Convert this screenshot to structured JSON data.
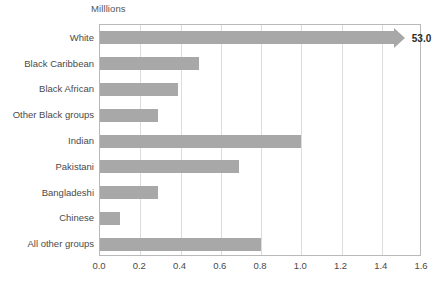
{
  "chart_data": {
    "type": "bar",
    "orientation": "horizontal",
    "title": "Milllions",
    "xlabel": "",
    "ylabel": "",
    "xlim": [
      0.0,
      1.6
    ],
    "xticks": [
      "0.0",
      "0.2",
      "0.4",
      "0.6",
      "0.8",
      "1.0",
      "1.2",
      "1.4",
      "1.6"
    ],
    "xtick_values": [
      0.0,
      0.2,
      0.4,
      0.6,
      0.8,
      1.0,
      1.2,
      1.4,
      1.6
    ],
    "grid": "vertical",
    "legend": "none",
    "bar_color": "#a8a8a8",
    "categories": [
      "White",
      "Black Caribbean",
      "Black African",
      "Other Black groups",
      "Indian",
      "Pakistani",
      "Bangladeshi",
      "Chinese",
      "All other groups"
    ],
    "values": [
      53.0,
      0.49,
      0.39,
      0.29,
      1.0,
      0.69,
      0.29,
      0.1,
      0.8
    ],
    "bars": [
      {
        "category": "White",
        "value": 53.0,
        "plotted": 1.46,
        "truncated": true,
        "label": "53.0"
      },
      {
        "category": "Black Caribbean",
        "value": 0.49,
        "plotted": 0.49,
        "truncated": false,
        "label": ""
      },
      {
        "category": "Black African",
        "value": 0.39,
        "plotted": 0.39,
        "truncated": false,
        "label": ""
      },
      {
        "category": "Other Black groups",
        "value": 0.29,
        "plotted": 0.29,
        "truncated": false,
        "label": ""
      },
      {
        "category": "Indian",
        "value": 1.0,
        "plotted": 1.0,
        "truncated": false,
        "label": ""
      },
      {
        "category": "Pakistani",
        "value": 0.69,
        "plotted": 0.69,
        "truncated": false,
        "label": ""
      },
      {
        "category": "Bangladeshi",
        "value": 0.29,
        "plotted": 0.29,
        "truncated": false,
        "label": ""
      },
      {
        "category": "Chinese",
        "value": 0.1,
        "plotted": 0.1,
        "truncated": false,
        "label": ""
      },
      {
        "category": "All other groups",
        "value": 0.8,
        "plotted": 0.8,
        "truncated": false,
        "label": ""
      }
    ],
    "annotations": [
      {
        "text": "53.0",
        "for": "White",
        "note": "value label beyond truncated bar arrow"
      }
    ]
  }
}
